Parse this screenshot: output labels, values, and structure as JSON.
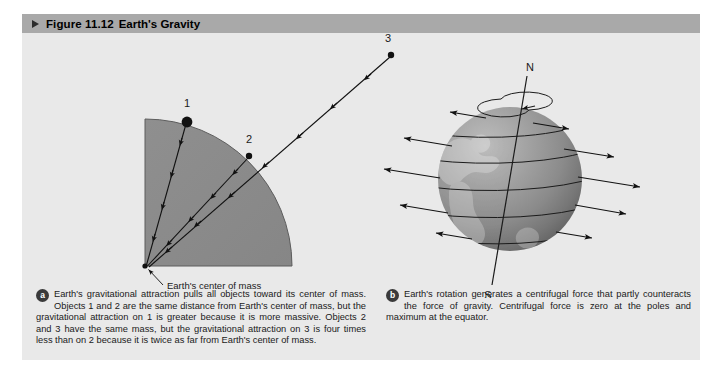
{
  "figure": {
    "number": "Figure 11.12",
    "title": "Earth's Gravity",
    "marker_icon": "triangle-right-icon",
    "panel_bg": "#e9e9e9",
    "header_bg": "#a9a9a9"
  },
  "panel_a": {
    "badge": "a",
    "caption": "Earth's gravitational attraction pulls all objects toward its center of mass. Objects 1 and 2 are the same distance from Earth's center of mass, but the gravitational attraction on 1 is greater because it is more massive. Objects 2 and 3 have the same mass, but the gravitational attraction on 3 is four times less than on 2 because it is twice as far from Earth's center of mass.",
    "earth_fill": "#8b8b8b",
    "center_label": "Earth's center of mass",
    "objects": [
      {
        "id": "1",
        "label": "1",
        "size": "large",
        "distance": "1R",
        "note": "more massive, on surface"
      },
      {
        "id": "2",
        "label": "2",
        "size": "small",
        "distance": "1R",
        "note": "less massive, on surface"
      },
      {
        "id": "3",
        "label": "3",
        "size": "small",
        "distance": "2R",
        "note": "same mass as 2, twice as far"
      }
    ]
  },
  "panel_b": {
    "badge": "b",
    "caption": "Earth's rotation generates a centrifugal force that partly counteracts the force of gravity. Centrifugal force is zero at the poles and maximum at the equator.",
    "globe_fill": "#8f8f8f",
    "pole_north_label": "N",
    "pole_south_label": "S",
    "rotation_icon": "rotation-arrow-icon",
    "force_arrows": [
      {
        "latitude": 75,
        "relative_length": 0.26
      },
      {
        "latitude": 50,
        "relative_length": 0.64
      },
      {
        "latitude": 25,
        "relative_length": 0.9
      },
      {
        "latitude": 0,
        "relative_length": 1.0
      },
      {
        "latitude": -25,
        "relative_length": 0.9
      },
      {
        "latitude": -50,
        "relative_length": 0.64
      },
      {
        "latitude": -75,
        "relative_length": 0.26
      }
    ]
  }
}
